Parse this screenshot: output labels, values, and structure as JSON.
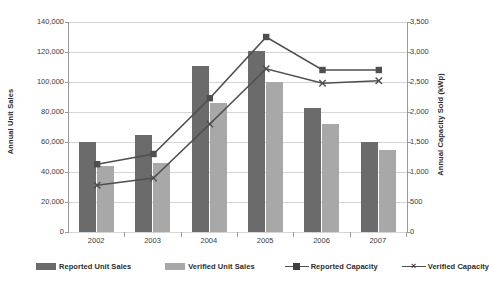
{
  "chart_data": {
    "type": "bar",
    "title": "",
    "subtitle": "",
    "xlabel": "",
    "ylabel": "Annual Unit Sales",
    "y2label": "Annual Capacity Sold (kWp)",
    "categories": [
      "2002",
      "2003",
      "2004",
      "2005",
      "2006",
      "2007"
    ],
    "ylim": [
      0,
      140000
    ],
    "y2lim": [
      0,
      3500
    ],
    "y_ticks": [
      "0",
      "20,000",
      "40,000",
      "60,000",
      "80,000",
      "100,000",
      "120,000",
      "140,000"
    ],
    "y_tick_values": [
      0,
      20000,
      40000,
      60000,
      80000,
      100000,
      120000,
      140000
    ],
    "y2_ticks": [
      "0",
      "500",
      "1,000",
      "1,500",
      "2,000",
      "2,500",
      "3,000",
      "3,500"
    ],
    "y2_tick_values": [
      0,
      500,
      1000,
      1500,
      2000,
      2500,
      3000,
      3500
    ],
    "grid": true,
    "legend_position": "bottom",
    "series": [
      {
        "name": "Reported Unit Sales",
        "type": "bar",
        "axis": "left",
        "color": "#6b6b6b",
        "values": [
          60000,
          65000,
          111000,
          121000,
          83000,
          60000
        ]
      },
      {
        "name": "Verified  Unit Sales",
        "type": "bar",
        "axis": "left",
        "color": "#a8a8a8",
        "values": [
          44000,
          46000,
          86000,
          100000,
          72000,
          55000
        ]
      },
      {
        "name": "Reported Capacity",
        "type": "line",
        "axis": "right",
        "color": "#4f4f4f",
        "marker": "square",
        "values": [
          1130,
          1300,
          2230,
          3250,
          2700,
          2700
        ]
      },
      {
        "name": "Verified Capacity",
        "type": "line",
        "axis": "right",
        "color": "#4f4f4f",
        "marker": "x",
        "values": [
          780,
          900,
          1800,
          2720,
          2480,
          2520
        ]
      }
    ]
  },
  "legend": {
    "items": [
      {
        "label": "Reported Unit Sales",
        "marker": "swatch-dark"
      },
      {
        "label": "Verified  Unit Sales",
        "marker": "swatch-light"
      },
      {
        "label": "Reported Capacity",
        "marker": "line-square"
      },
      {
        "label": "Verified Capacity",
        "marker": "line-x"
      }
    ]
  }
}
